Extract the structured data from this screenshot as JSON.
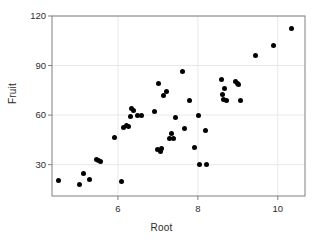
{
  "chart_data": {
    "type": "scatter",
    "title": "",
    "xlabel": "Root",
    "ylabel": "Fruit",
    "xlim": [
      4.35,
      10.68
    ],
    "ylim": [
      11.0,
      120.0
    ],
    "xticks": [
      6,
      8,
      10
    ],
    "yticks": [
      30,
      60,
      90,
      120
    ],
    "xtick_labels": [
      "6",
      "8",
      "10"
    ],
    "ytick_labels": [
      "30",
      "60",
      "90",
      "120"
    ],
    "grid": true,
    "grid_color": "#e8e8e8",
    "legend": "none",
    "marker": "filled-circle",
    "marker_color": "#000000",
    "frame_color": "#808080",
    "n_points": 48,
    "x": [
      4.52,
      5.04,
      5.14,
      5.28,
      5.47,
      5.52,
      5.57,
      5.92,
      6.08,
      6.13,
      6.22,
      6.27,
      6.31,
      6.33,
      6.38,
      6.49,
      6.58,
      6.91,
      6.98,
      7.02,
      7.06,
      7.09,
      7.15,
      7.21,
      7.28,
      7.34,
      7.39,
      7.43,
      7.62,
      7.66,
      7.79,
      7.92,
      8.02,
      8.04,
      8.18,
      8.22,
      8.58,
      8.62,
      8.64,
      8.66,
      8.71,
      8.94,
      8.98,
      9.02,
      9.06,
      9.44,
      9.88,
      10.34
    ],
    "y": [
      20.4,
      18.2,
      24.6,
      21.2,
      33.4,
      32.6,
      31.8,
      46.3,
      19.6,
      52.4,
      53.6,
      52.8,
      59.4,
      63.8,
      62.6,
      59.8,
      59.9,
      62.1,
      39.0,
      79.1,
      38.2,
      40.0,
      71.6,
      74.2,
      45.8,
      49.1,
      45.6,
      58.4,
      86.1,
      51.8,
      69.0,
      40.2,
      59.5,
      30.2,
      50.4,
      30.1,
      81.3,
      72.4,
      69.7,
      75.8,
      68.9,
      80.4,
      79.0,
      78.8,
      68.6,
      96.3,
      102.1,
      112.6
    ]
  }
}
